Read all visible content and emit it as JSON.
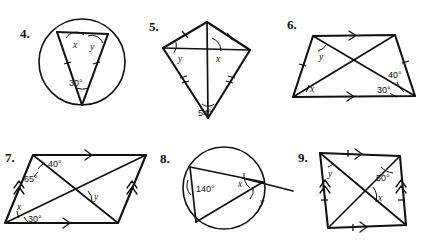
{
  "worksheet": {
    "title": "Geometry angle problems 4-9",
    "ink_color": "#111111",
    "background": "#ffffff",
    "problems": [
      {
        "number": "4.",
        "figure": "circle-with-two-chords-inscribed-angle",
        "labels": {
          "x": "x",
          "y": "y",
          "central_angle": "30°"
        }
      },
      {
        "number": "5.",
        "figure": "kite-with-diagonals",
        "labels": {
          "y": "y",
          "x": "x",
          "vertex_angle": "54°"
        }
      },
      {
        "number": "6.",
        "figure": "trapezoid-with-diagonals",
        "labels": {
          "y": "y",
          "x": "x",
          "angle_upper": "40°",
          "angle_lower": "30°"
        }
      },
      {
        "number": "7.",
        "figure": "parallelogram-with-diagonals",
        "labels": {
          "angle_top": "40°",
          "angle_left": "65°",
          "y": "y",
          "x": "x",
          "angle_bottom": "30°"
        }
      },
      {
        "number": "8.",
        "figure": "circle-with-inscribed-angle-and-tangent",
        "labels": {
          "inscribed_angle": "140°",
          "x": "x",
          "y": "y"
        }
      },
      {
        "number": "9.",
        "figure": "parallelogram-with-diagonals",
        "labels": {
          "y": "y",
          "angle_top_right": "50°",
          "x": "x"
        }
      }
    ]
  }
}
